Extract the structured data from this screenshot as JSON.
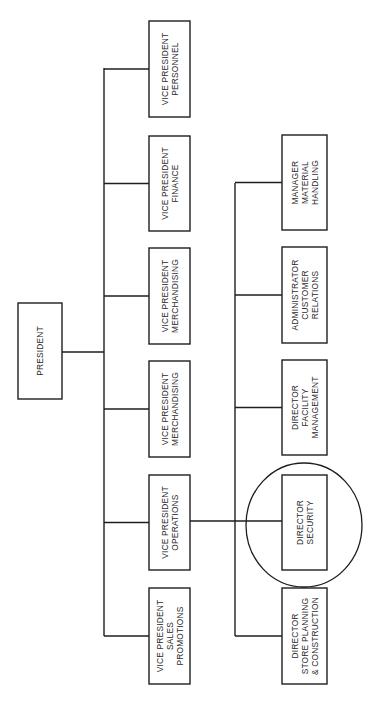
{
  "chart_data": {
    "type": "org-chart",
    "orientation": "rotated-90-ccw",
    "root": {
      "id": "president",
      "label": [
        "PRESIDENT"
      ],
      "box": {
        "x": 18,
        "y": 303,
        "w": 44,
        "h": 96
      },
      "children": [
        {
          "id": "vp-personnel",
          "label": [
            "VICE PRESIDENT",
            "PERSONNEL"
          ],
          "box": {
            "x": 149,
            "y": 21,
            "w": 41,
            "h": 96
          }
        },
        {
          "id": "vp-finance",
          "label": [
            "VICE PRESIDENT",
            "FINANCE"
          ],
          "box": {
            "x": 149,
            "y": 136,
            "w": 41,
            "h": 95
          }
        },
        {
          "id": "vp-merchandising-1",
          "label": [
            "VICE PRESIDENT",
            "MERCHANDISING"
          ],
          "box": {
            "x": 149,
            "y": 248,
            "w": 41,
            "h": 96
          }
        },
        {
          "id": "vp-merchandising-2",
          "label": [
            "VICE PRESIDENT",
            "MERCHANDISING"
          ],
          "box": {
            "x": 149,
            "y": 361,
            "w": 41,
            "h": 96
          }
        },
        {
          "id": "vp-operations",
          "label": [
            "VICE PRESIDENT",
            "OPERATIONS"
          ],
          "box": {
            "x": 149,
            "y": 475,
            "w": 41,
            "h": 95
          },
          "children": [
            {
              "id": "mgr-material-handling",
              "label": [
                "MANAGER",
                "MATERIAL",
                "HANDLING"
              ],
              "box": {
                "x": 282,
                "y": 135,
                "w": 45,
                "h": 95
              }
            },
            {
              "id": "admin-customer-relations",
              "label": [
                "ADMINISTRATOR",
                "CUSTOMER",
                "RELATIONS"
              ],
              "box": {
                "x": 282,
                "y": 247,
                "w": 45,
                "h": 96
              }
            },
            {
              "id": "dir-facility-management",
              "label": [
                "DIRECTOR",
                "FACILITY",
                "MANAGEMENT"
              ],
              "box": {
                "x": 282,
                "y": 360,
                "w": 45,
                "h": 95
              }
            },
            {
              "id": "dir-security",
              "label": [
                "DIRECTOR",
                "SECURITY"
              ],
              "box": {
                "x": 282,
                "y": 475,
                "w": 45,
                "h": 95
              },
              "highlighted": true
            },
            {
              "id": "dir-store-planning",
              "label": [
                "DIRECTOR",
                "STORE PLANNING",
                "& CONSTRUCTION"
              ],
              "box": {
                "x": 282,
                "y": 588,
                "w": 45,
                "h": 96
              }
            }
          ]
        },
        {
          "id": "vp-sales-promotions",
          "label": [
            "VICE PRESIDENT",
            "SALES",
            "PROMOTIONS"
          ],
          "box": {
            "x": 149,
            "y": 588,
            "w": 41,
            "h": 96
          }
        }
      ]
    },
    "highlight": {
      "node": "dir-security",
      "shape": "circle",
      "cx": 304,
      "cy": 525,
      "rx": 58,
      "ry": 62
    },
    "trunks": {
      "level1": {
        "x": 104,
        "y1": 68,
        "y2": 636,
        "president_connector_y": 352
      },
      "level2": {
        "x": 235,
        "y1": 183,
        "y2": 636,
        "operations_connector_y": 521
      }
    }
  },
  "colors": {
    "line": "#1e1e1e",
    "text": "#2a2a2a",
    "background": "#ffffff"
  }
}
